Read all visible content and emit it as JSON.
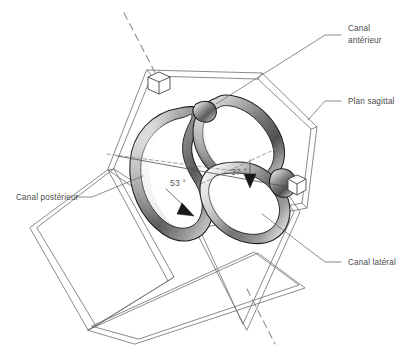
{
  "figure": {
    "background_color": "#ffffff",
    "width": 411,
    "height": 356
  },
  "labels": {
    "canal_anterieur": {
      "line1": "Canal",
      "line2": "antérieur",
      "name": "canal-anterieur-label"
    },
    "plan_sagittal": {
      "line1": "Plan sagittal",
      "name": "plan-sagittal-label"
    },
    "canal_lateral": {
      "line1": "Canal latéral",
      "name": "canal-lateral-label"
    },
    "canal_posterieur": {
      "line1": "Canal postérieur",
      "name": "canal-posterieur-label"
    }
  },
  "angles": {
    "posterior": {
      "value": "53",
      "unit": "°",
      "display": "53 °"
    },
    "anterior": {
      "value": "37",
      "unit": "°",
      "display": "37 °"
    }
  },
  "icons": {
    "cube_top_left": "cube-icon",
    "cube_right": "cube-icon",
    "arrow_posterior": "arrow-down-left-icon",
    "arrow_anterior": "arrow-down-icon"
  },
  "colors": {
    "ink": "#1d1d1d",
    "line": "#6d6d6d",
    "text": "#4a4a4a",
    "dash": "#8d8d8d",
    "paper": "#ffffff"
  }
}
